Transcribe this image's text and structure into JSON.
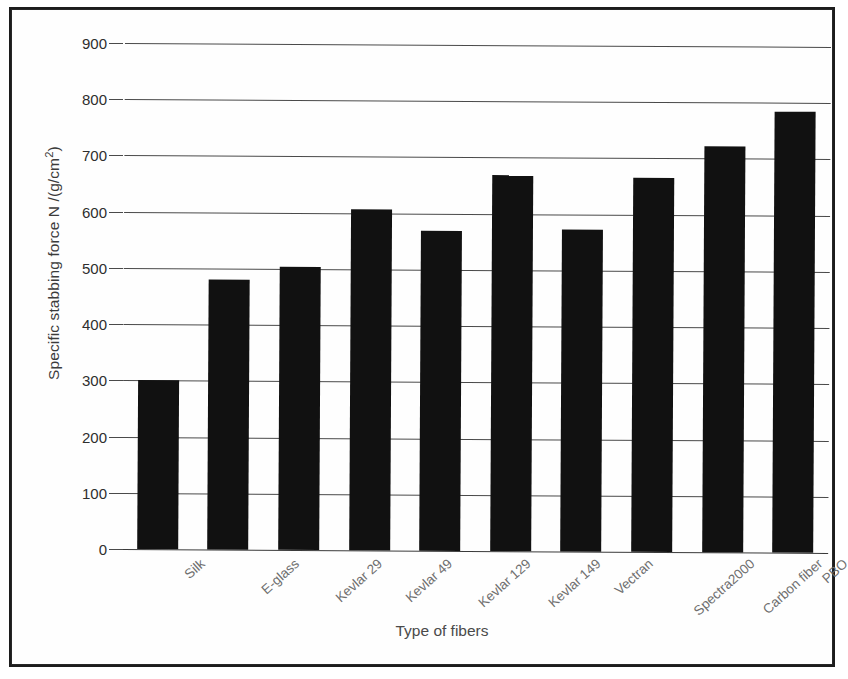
{
  "figure": {
    "background_color": "#ffffff",
    "frame_color": "#1c1c1c",
    "bar_color": "#111111",
    "grid_color": "#4a4a4a",
    "label_color": "#6f6f6f"
  },
  "axes": {
    "x_title": "Type of fibers",
    "y_title_plain": "Specific stabbing force N /(g/cm2)",
    "y_title_main": "Specific stabbing force N /(g/cm",
    "y_title_sup": "2",
    "y_title_close": ")"
  },
  "chart_data": {
    "type": "bar",
    "title": "",
    "xlabel": "Type of fibers",
    "ylabel": "Specific stabbing force N /(g/cm²)",
    "ylim": [
      0,
      900
    ],
    "ytick_labels": [
      "900",
      "800",
      "700",
      "600",
      "500",
      "400",
      "300",
      "200",
      "100",
      "0"
    ],
    "yticks": [
      900,
      800,
      700,
      600,
      500,
      400,
      300,
      200,
      100,
      0
    ],
    "grid": true,
    "grid_axis": "y",
    "legend": false,
    "legend_position": "none",
    "orientation": "vertical",
    "bar_color": "#111111",
    "categories": [
      "Silk",
      "E-glass",
      "Kevlar 29",
      "Kevlar 49",
      "Kevlar 129",
      "Kevlar 149",
      "Vectran",
      "Spectra2000",
      "Carbon fiber",
      "PBO"
    ],
    "values": [
      301,
      481,
      503,
      606,
      570,
      668,
      573,
      665,
      722,
      785
    ]
  }
}
